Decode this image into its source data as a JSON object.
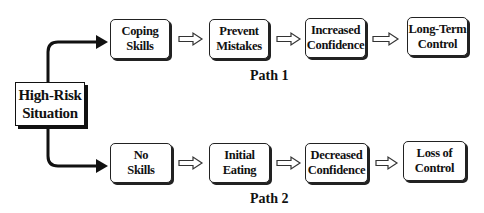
{
  "diagram": {
    "start": {
      "line1": "High-Risk",
      "line2": "Situation"
    },
    "path1": {
      "label": "Path 1",
      "nodes": [
        {
          "line1": "Coping",
          "line2": "Skills"
        },
        {
          "line1": "Prevent",
          "line2": "Mistakes"
        },
        {
          "line1": "Increased",
          "line2": "Confidence"
        },
        {
          "line1": "Long-Term",
          "line2": "Control"
        }
      ]
    },
    "path2": {
      "label": "Path 2",
      "nodes": [
        {
          "line1": "No",
          "line2": "Skills"
        },
        {
          "line1": "Initial",
          "line2": "Eating"
        },
        {
          "line1": "Decreased",
          "line2": "Confidence"
        },
        {
          "line1": "Loss of",
          "line2": "Control"
        }
      ]
    },
    "edges": [
      {
        "from": "High-Risk Situation",
        "to": "Coping Skills",
        "style": "solid-curved"
      },
      {
        "from": "High-Risk Situation",
        "to": "No Skills",
        "style": "solid-curved"
      },
      {
        "from": "Coping Skills",
        "to": "Prevent Mistakes",
        "style": "hollow-arrow"
      },
      {
        "from": "Prevent Mistakes",
        "to": "Increased Confidence",
        "style": "hollow-arrow"
      },
      {
        "from": "Increased Confidence",
        "to": "Long-Term Control",
        "style": "hollow-arrow"
      },
      {
        "from": "No Skills",
        "to": "Initial Eating",
        "style": "hollow-arrow"
      },
      {
        "from": "Initial Eating",
        "to": "Decreased Confidence",
        "style": "hollow-arrow"
      },
      {
        "from": "Decreased Confidence",
        "to": "Loss of Control",
        "style": "hollow-arrow"
      }
    ]
  }
}
